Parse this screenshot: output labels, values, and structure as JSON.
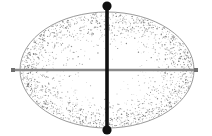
{
  "canvas": {
    "width": 212,
    "height": 136,
    "background": "#ffffff",
    "title": "Stippled ellipse with major and minor axis lines"
  },
  "chart_data": {
    "type": "scatter",
    "title": "",
    "subtitle": "",
    "xlabel": "",
    "ylabel": "",
    "grid": false,
    "legend": false,
    "xlim": [
      0,
      212
    ],
    "ylim": [
      0,
      136
    ],
    "annotations": [],
    "shapes": [
      {
        "name": "ellipse-body",
        "kind": "ellipse",
        "cx": 107,
        "cy": 70,
        "rx": 87,
        "ry": 58,
        "fill": "#ffffff",
        "stroke": "#9a9a9a",
        "stroke_width": 1,
        "texture": "stipple"
      },
      {
        "name": "vertical-axis-line",
        "kind": "line",
        "x1": 107,
        "y1": 10,
        "x2": 107,
        "y2": 128,
        "stroke": "#111111",
        "stroke_width": 3.6
      },
      {
        "name": "horizontal-axis-line",
        "kind": "line",
        "x1": 13,
        "y1": 70,
        "x2": 197,
        "y2": 70,
        "stroke": "#8a8a8a",
        "stroke_width": 2.6
      }
    ],
    "markers": [
      {
        "name": "top-endpoint-dot",
        "shape": "circle",
        "x": 107,
        "y": 6,
        "size": 4.6,
        "color": "#111111"
      },
      {
        "name": "bottom-endpoint-dot",
        "shape": "circle",
        "x": 107,
        "y": 130,
        "size": 4.6,
        "color": "#111111"
      },
      {
        "name": "left-endpoint-square",
        "shape": "square",
        "x": 13,
        "y": 70,
        "size": 4.0,
        "color": "#6f6f6f"
      },
      {
        "name": "right-endpoint-square",
        "shape": "square",
        "x": 196,
        "y": 70,
        "size": 4.0,
        "color": "#6f6f6f"
      }
    ],
    "stipple": {
      "description": "Randomized dot texture inside ellipse, denser toward the rim",
      "color": "#6b6b6b",
      "count": 2100,
      "dot_radius": 0.45,
      "edge_bias": 2.6
    }
  }
}
